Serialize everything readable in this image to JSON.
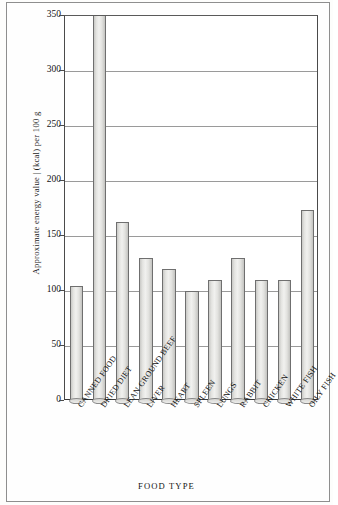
{
  "chart_data": {
    "type": "bar",
    "title": "",
    "xlabel": "FOOD TYPE",
    "ylabel": "Approximate energy value | (kcal) per 100 g",
    "ylim": [
      0,
      350
    ],
    "yticks": [
      0,
      50,
      100,
      150,
      200,
      250,
      300,
      350
    ],
    "grid": true,
    "legend": "none",
    "categories": [
      "CANNED FOOD",
      "DRIED DIET",
      "LEAN GROUND BEEF",
      "LIVER",
      "HEART",
      "SPLEEN",
      "LUNGS",
      "RABBIT",
      "CHICKEN",
      "WHITE FISH",
      "OILY FISH"
    ],
    "values": [
      105,
      350,
      163,
      130,
      120,
      100,
      110,
      130,
      110,
      110,
      174
    ],
    "value_notes": [
      "bar for DRIED DIET is clipped at the axis maximum of 350 and extends beyond the plot"
    ],
    "colors": {
      "bar_fill": "#eaeae7",
      "bar_edge": "#6f6f6f",
      "gridline": "#9a9a9a",
      "axis": "#4a4a4a",
      "text": "#141414",
      "page": "#fefefe"
    }
  }
}
